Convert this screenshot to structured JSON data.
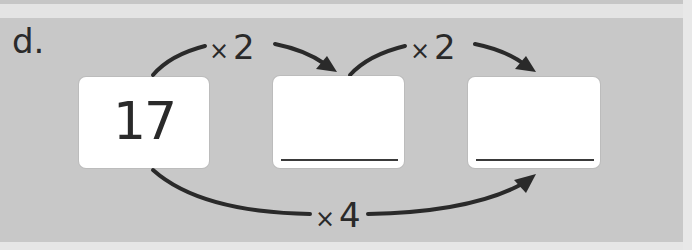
{
  "problem": {
    "label": "d.",
    "boxes": [
      {
        "value": "17",
        "is_answer": false
      },
      {
        "value": "",
        "is_answer": true
      },
      {
        "value": "",
        "is_answer": true
      }
    ],
    "operations": [
      {
        "symbol": "×",
        "factor": "2",
        "from": 0,
        "to": 1,
        "position": "top"
      },
      {
        "symbol": "×",
        "factor": "2",
        "from": 1,
        "to": 2,
        "position": "top"
      },
      {
        "symbol": "×",
        "factor": "4",
        "from": 0,
        "to": 2,
        "position": "bottom"
      }
    ]
  },
  "colors": {
    "panel": "#c8c8c8",
    "box": "#ffffff",
    "ink": "#2a2a2a"
  }
}
